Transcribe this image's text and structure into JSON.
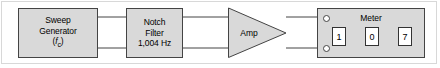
{
  "figure": {
    "width": 440,
    "height": 68,
    "background_color": "#ffffff",
    "block_fill_color": "#d9d9d9",
    "line_color": "#444444",
    "text_color": "#000000"
  },
  "blocks": {
    "sweep_generator": {
      "name": "Sweep Generator",
      "line1": "Sweep",
      "line2": "Generator",
      "symbol_open": "(",
      "symbol_var": "f",
      "symbol_sub": "c",
      "symbol_close": ")"
    },
    "notch_filter": {
      "name": "Notch Filter",
      "line1": "Notch",
      "line2": "Filter",
      "line3": "1,004 Hz"
    },
    "amplifier": {
      "label": "Amp"
    },
    "meter": {
      "title": "Meter",
      "digits": [
        "1",
        "0",
        "7"
      ],
      "reading": "107",
      "terminals": [
        "top-terminal",
        "bottom-terminal"
      ]
    }
  },
  "connections": [
    {
      "from": "sweep_generator",
      "to": "notch_filter",
      "conductors": 2
    },
    {
      "from": "notch_filter",
      "to": "amplifier",
      "conductors": 2
    },
    {
      "from": "amplifier",
      "to": "meter",
      "conductors": 2
    }
  ]
}
